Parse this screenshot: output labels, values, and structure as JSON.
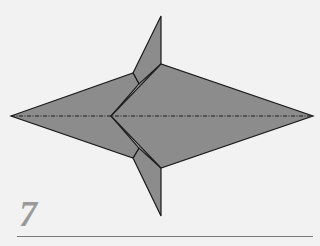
{
  "diagram": {
    "step_number": "7",
    "colors": {
      "background": "#f2f2f2",
      "paper": "#8c8c8c",
      "outline": "#1a1a1a",
      "step_number": "#9a9a9a",
      "rule": "#7a7a7a"
    },
    "shapes": {
      "top_fin": "133,73 161,16 161,64 139,84",
      "bottom_fin": "133,158 139,148 161,168 161,216",
      "left_kite": "11,116 133,73 139,84 111,116 139,148 133,158",
      "right_diamond": "111,116 161,64 313,116 161,168"
    },
    "valley_fold_line": {
      "x1": 11,
      "y1": 116,
      "x2": 313,
      "y2": 116,
      "style": "dash-dot"
    }
  }
}
